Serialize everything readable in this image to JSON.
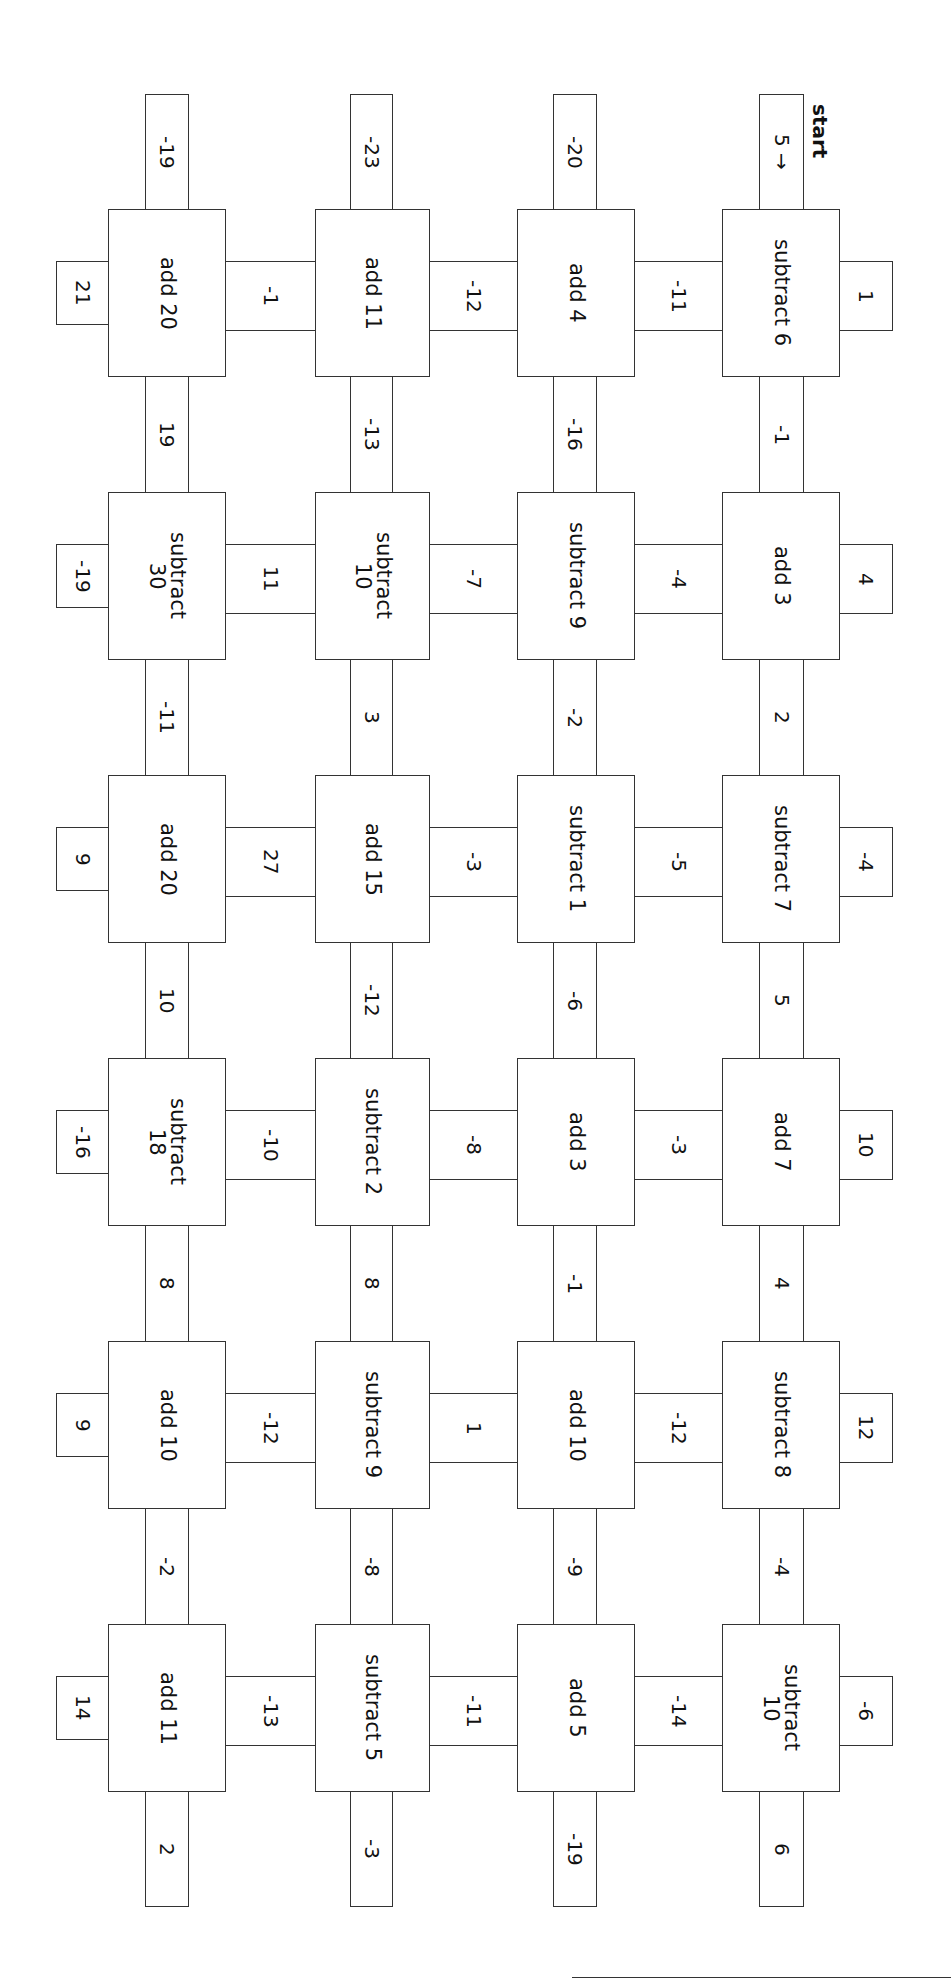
{
  "worksheet": {
    "start_label": "start",
    "start_value": "5 →",
    "orientation": "rotated 90° clockwise",
    "columns": [
      {
        "top_tab": "5 →",
        "boxes": [
          "subtract 6",
          "add 3",
          "subtract 7",
          "add 7",
          "subtract 8",
          "subtract\n10"
        ],
        "right_tabs": [
          "1",
          "4",
          "-4",
          "10",
          "12",
          "-6"
        ],
        "down_connectors": [
          "-1",
          "2",
          "5",
          "4",
          "-4"
        ],
        "bottom_tab": "6"
      },
      {
        "top_tab": "-20",
        "boxes": [
          "add 4",
          "subtract 9",
          "subtract 1",
          "add 3",
          "add 10",
          "add 5"
        ],
        "down_connectors": [
          "-16",
          "-2",
          "-6",
          "-1",
          "-9"
        ],
        "bottom_tab": "-19"
      },
      {
        "top_tab": "-23",
        "boxes": [
          "add 11",
          "subtract\n10",
          "add 15",
          "subtract 2",
          "subtract 9",
          "subtract 5"
        ],
        "down_connectors": [
          "-13",
          "3",
          "-12",
          "8",
          "-8"
        ],
        "bottom_tab": "-3"
      },
      {
        "top_tab": "-19",
        "boxes": [
          "add 20",
          "subtract\n30",
          "add 20",
          "subtract\n18",
          "add 10",
          "add 11"
        ],
        "left_tabs": [
          "21",
          "-19",
          "9",
          "-16",
          "9",
          "14"
        ],
        "down_connectors": [
          "19",
          "-11",
          "10",
          "8",
          "-2"
        ],
        "bottom_tab": "2"
      }
    ],
    "side_connectors": {
      "d_c": [
        "-11",
        "-4",
        "-5",
        "-3",
        "-12",
        "-14"
      ],
      "c_b": [
        "-12",
        "-7",
        "-3",
        "-8",
        "1",
        "-11"
      ],
      "b_a": [
        "-1",
        "11",
        "27",
        "-10",
        "-12",
        "-13"
      ]
    }
  }
}
